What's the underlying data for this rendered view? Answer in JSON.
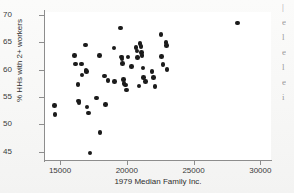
{
  "chart_data": {
    "type": "scatter",
    "title": "",
    "xlabel": "1979 Median Family Inc.",
    "ylabel": "% HHs with 2+ workers",
    "xlim": [
      13800,
      30800
    ],
    "ylim": [
      43.5,
      70.5
    ],
    "xticks": [
      15000,
      20000,
      25000,
      30000
    ],
    "yticks": [
      45,
      50,
      55,
      60,
      65,
      70
    ],
    "xtick_labels": [
      "15000",
      "20000",
      "25000",
      "30000"
    ],
    "ytick_labels": [
      "45",
      "50",
      "55",
      "60",
      "65",
      "70"
    ],
    "grid": false,
    "legend": null,
    "marker": "filled-circle",
    "marker_color": "#1b1b1b",
    "points": [
      {
        "x": 14600,
        "y": 53.4
      },
      {
        "x": 14620,
        "y": 51.8
      },
      {
        "x": 16100,
        "y": 62.6
      },
      {
        "x": 16170,
        "y": 61.0
      },
      {
        "x": 16350,
        "y": 57.3
      },
      {
        "x": 16400,
        "y": 54.3
      },
      {
        "x": 16430,
        "y": 54.0
      },
      {
        "x": 16600,
        "y": 61.0
      },
      {
        "x": 16650,
        "y": 59.0
      },
      {
        "x": 16900,
        "y": 64.5
      },
      {
        "x": 16950,
        "y": 59.8
      },
      {
        "x": 17000,
        "y": 59.6
      },
      {
        "x": 17020,
        "y": 53.2
      },
      {
        "x": 17150,
        "y": 52.1
      },
      {
        "x": 17250,
        "y": 44.8
      },
      {
        "x": 17750,
        "y": 54.8
      },
      {
        "x": 17950,
        "y": 62.6
      },
      {
        "x": 18000,
        "y": 48.5
      },
      {
        "x": 18350,
        "y": 58.8
      },
      {
        "x": 18420,
        "y": 53.6
      },
      {
        "x": 18600,
        "y": 58.0
      },
      {
        "x": 19050,
        "y": 63.9
      },
      {
        "x": 19100,
        "y": 57.8
      },
      {
        "x": 19550,
        "y": 67.6
      },
      {
        "x": 19620,
        "y": 62.3
      },
      {
        "x": 19650,
        "y": 61.9
      },
      {
        "x": 19700,
        "y": 61.1
      },
      {
        "x": 19750,
        "y": 58.2
      },
      {
        "x": 19800,
        "y": 57.5
      },
      {
        "x": 19900,
        "y": 57.2
      },
      {
        "x": 20000,
        "y": 56.3
      },
      {
        "x": 20100,
        "y": 62.3
      },
      {
        "x": 20350,
        "y": 60.6
      },
      {
        "x": 20700,
        "y": 64.0
      },
      {
        "x": 20750,
        "y": 63.4
      },
      {
        "x": 20800,
        "y": 62.2
      },
      {
        "x": 20900,
        "y": 57.0
      },
      {
        "x": 21000,
        "y": 64.7
      },
      {
        "x": 21050,
        "y": 64.2
      },
      {
        "x": 21100,
        "y": 63.1
      },
      {
        "x": 21150,
        "y": 62.6
      },
      {
        "x": 21200,
        "y": 60.3
      },
      {
        "x": 21250,
        "y": 58.6
      },
      {
        "x": 21400,
        "y": 57.8
      },
      {
        "x": 21900,
        "y": 59.6
      },
      {
        "x": 22000,
        "y": 58.5
      },
      {
        "x": 22100,
        "y": 56.9
      },
      {
        "x": 22550,
        "y": 66.4
      },
      {
        "x": 22600,
        "y": 62.4
      },
      {
        "x": 22700,
        "y": 60.9
      },
      {
        "x": 22950,
        "y": 64.9
      },
      {
        "x": 22980,
        "y": 64.4
      },
      {
        "x": 23000,
        "y": 60.0
      },
      {
        "x": 28300,
        "y": 68.5
      }
    ]
  },
  "right_margin": {
    "fragments": [
      "|",
      "e",
      "l",
      "e",
      "l",
      "e",
      "i"
    ]
  }
}
